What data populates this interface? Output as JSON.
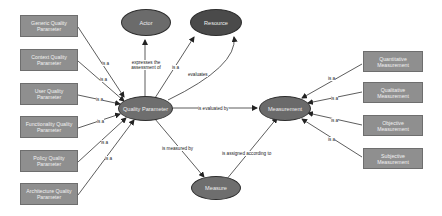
{
  "diagram": {
    "nodes": {
      "actor": {
        "label": "Actor",
        "shape": "ellipse",
        "fill": "#6b6b6b"
      },
      "resource": {
        "label": "Resource",
        "shape": "ellipse",
        "fill": "#4a4a4a"
      },
      "quality_parameter": {
        "label": "Quality Parameter",
        "shape": "ellipse",
        "fill": "#6e6e6e"
      },
      "measurement": {
        "label": "Measurement",
        "shape": "ellipse",
        "fill": "#6a6a6a"
      },
      "measure": {
        "label": "Measure",
        "shape": "ellipse",
        "fill": "#6e6e6e"
      },
      "left_boxes": [
        {
          "label": "Generic Quality Parameter"
        },
        {
          "label": "Context Quality Parameter"
        },
        {
          "label": "User Quality Parameter"
        },
        {
          "label": "Functionality Quality Parameter"
        },
        {
          "label": "Policy Quality Parameter"
        },
        {
          "label": "Architecture Quality Parameter"
        }
      ],
      "right_boxes": [
        {
          "label": "Quantitative Measurement"
        },
        {
          "label": "Qualitative Measurement"
        },
        {
          "label": "Objective Measurement"
        },
        {
          "label": "Subjective Measurement"
        }
      ]
    },
    "edge_labels": {
      "is_a": "is a",
      "expresses": "expresses the assessment of",
      "evaluates": "evaluates",
      "is_evaluated_by": "is evaluated by",
      "is_measured_by": "is measured by",
      "is_assigned": "is assigned according to"
    },
    "colors": {
      "box_fill": "#8f8f8f",
      "edge": "#333333"
    }
  }
}
